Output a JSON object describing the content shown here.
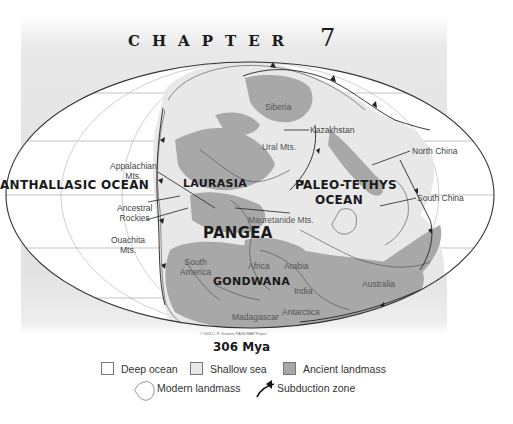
{
  "header": {
    "chapter_word": "CHAPTER",
    "chapter_number": "7"
  },
  "map": {
    "projection": "elliptical (Mollweide-style) world map",
    "time_label": "306 Mya",
    "copyright": "© 2001 C. R. Scotese, PALEOMAP Project",
    "oceans": {
      "panthalassic": "ANTHALLASIC OCEAN",
      "paleo_tethys_line1": "PALEO-TETHYS",
      "paleo_tethys_line2": "OCEAN"
    },
    "supercontinents": {
      "laurasia": "LAURASIA",
      "pangea": "PANGEA",
      "gondwana": "GONDWANA"
    },
    "labels": {
      "siberia": "Siberia",
      "kazakhstan": "Kazakhstan",
      "ural_mts": "Ural Mts.",
      "north_china": "North China",
      "south_china": "South China",
      "appalachian_line1": "Appalachian",
      "appalachian_line2": "Mts.",
      "ancestral_rockies_line1": "Ancestral",
      "ancestral_rockies_line2": "Rockies",
      "ouachita_line1": "Ouachita",
      "ouachita_line2": "Mts.",
      "mauretanide_mts": "Mauretanide Mts.",
      "south_america_line1": "South",
      "south_america_line2": "America",
      "africa": "Africa",
      "arabia": "Arabia",
      "india": "India",
      "australia": "Australia",
      "antarctica": "Antarctica",
      "madagascar": "Madagascar"
    },
    "colors": {
      "deep_ocean": "#ffffff",
      "shallow_sea": "#e8e8e8",
      "ancient_landmass": "#a8a8a8",
      "outline": "#333333",
      "graticule": "#9a9a9a",
      "background_panel": "#e4e4e4"
    }
  },
  "legend": {
    "items": [
      {
        "label": "Deep ocean",
        "icon": "white-square-swatch"
      },
      {
        "label": "Shallow sea",
        "icon": "light-gray-square-swatch"
      },
      {
        "label": "Ancient landmass",
        "icon": "dark-gray-square-swatch"
      },
      {
        "label": "Modern landmass",
        "icon": "outline-shape-icon"
      },
      {
        "label": "Subduction zone",
        "icon": "barbed-line-icon"
      }
    ]
  }
}
